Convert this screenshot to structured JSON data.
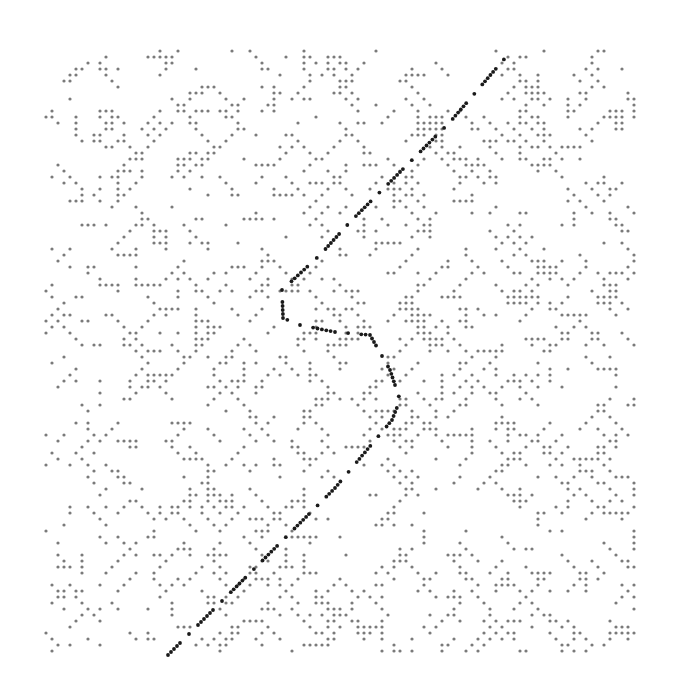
{
  "chart_data": {
    "type": "scatter",
    "subtype": "dot-plot (sequence self-comparison / recurrence plot)",
    "title": "",
    "xlabel": "",
    "ylabel": "",
    "axes_visible": false,
    "grid": false,
    "legend": null,
    "plot_area_px": {
      "x0": 45,
      "y0": 50,
      "x1": 636,
      "y1": 655
    },
    "dot_spacing_px": 6,
    "background_dots": {
      "color": "#7a7a7a",
      "radius_px": 1.6,
      "density": 0.17,
      "diagonal_run_bias": 0.45,
      "seed": 1337
    },
    "main_path": {
      "color": "#1a1a1a",
      "radius_px": 1.9,
      "style": "dash-dot diagonal",
      "points_px": [
        [
          168,
          655
        ],
        [
          225,
          598
        ],
        [
          280,
          543
        ],
        [
          335,
          488
        ],
        [
          392,
          420
        ],
        [
          400,
          400
        ],
        [
          390,
          370
        ],
        [
          370,
          335
        ],
        [
          335,
          332
        ],
        [
          300,
          325
        ],
        [
          283,
          318
        ],
        [
          282,
          290
        ],
        [
          320,
          255
        ],
        [
          350,
          222
        ],
        [
          400,
          172
        ],
        [
          450,
          122
        ],
        [
          512,
          50
        ]
      ]
    },
    "series": [
      {
        "name": "background matches",
        "kind": "scatter-dots"
      },
      {
        "name": "main alignment diagonal",
        "kind": "line-dots"
      }
    ]
  }
}
